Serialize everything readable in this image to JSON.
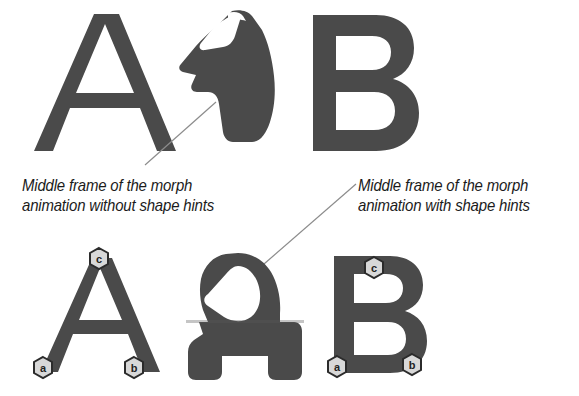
{
  "figure": {
    "background_color": "#ffffff",
    "ink_color": "#4a4a4a",
    "ink_color_dark": "#3f3f3f",
    "leader_line_color": "#8c8c8c",
    "marker_fill": "#d8d8d8",
    "marker_stroke": "#2b2b2b",
    "text_color": "#1b1b1b"
  },
  "captions": {
    "without_hints": {
      "line1": "Middle frame of the morph",
      "line2": "animation without shape hints"
    },
    "with_hints": {
      "line1": "Middle frame of the morph",
      "line2": "animation with shape hints"
    }
  },
  "rows": {
    "top": {
      "source_letter": "A",
      "morph_label": "morph-frame-without-hints",
      "target_letter": "B"
    },
    "bottom": {
      "source_letter": "A",
      "morph_label": "morph-frame-with-hints",
      "target_letter": "B"
    }
  },
  "hints": {
    "letter_a_markers": [
      {
        "label": "c",
        "x": 99,
        "y": 259
      },
      {
        "label": "a",
        "x": 43,
        "y": 368
      },
      {
        "label": "b",
        "x": 134,
        "y": 368
      }
    ],
    "letter_b_markers": [
      {
        "label": "c",
        "x": 374,
        "y": 268
      },
      {
        "label": "a",
        "x": 337,
        "y": 367
      },
      {
        "label": "b",
        "x": 412,
        "y": 365
      }
    ]
  },
  "leader_lines": [
    {
      "name": "leader-without-hints",
      "x1": 145,
      "y1": 165,
      "x2": 216,
      "y2": 102
    },
    {
      "name": "leader-with-hints",
      "x1": 264,
      "y1": 264,
      "x2": 356,
      "y2": 184
    }
  ]
}
